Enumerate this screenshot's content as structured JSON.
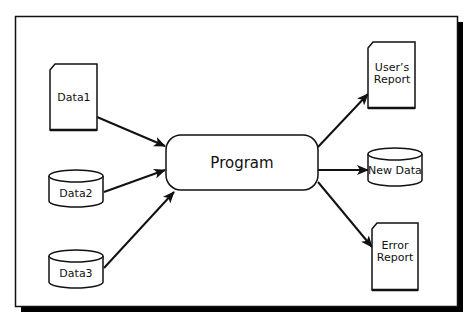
{
  "diagram": {
    "type": "data-flow",
    "center": {
      "id": "program",
      "label": "Program",
      "shape": "rounded-rectangle"
    },
    "inputs": [
      {
        "id": "data1",
        "label": "Data1",
        "shape": "document"
      },
      {
        "id": "data2",
        "label": "Data2",
        "shape": "cylinder"
      },
      {
        "id": "data3",
        "label": "Data3",
        "shape": "cylinder"
      }
    ],
    "outputs": [
      {
        "id": "users-report",
        "label_lines": [
          "User’s",
          "Report"
        ],
        "shape": "document"
      },
      {
        "id": "new-data",
        "label": "New Data",
        "shape": "cylinder"
      },
      {
        "id": "error-report",
        "label_lines": [
          "Error",
          "Report"
        ],
        "shape": "document"
      }
    ],
    "edges": [
      {
        "from": "data1",
        "to": "program"
      },
      {
        "from": "data2",
        "to": "program"
      },
      {
        "from": "data3",
        "to": "program"
      },
      {
        "from": "program",
        "to": "users-report"
      },
      {
        "from": "program",
        "to": "new-data"
      },
      {
        "from": "program",
        "to": "error-report"
      }
    ],
    "colors": {
      "stroke": "#111111",
      "fill": "#ffffff",
      "shadow": "#000000"
    }
  }
}
